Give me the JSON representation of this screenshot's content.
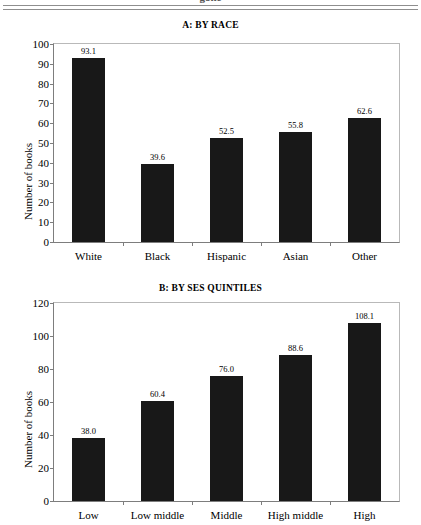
{
  "header": {
    "clipped_running_head": "gone"
  },
  "charts": [
    {
      "id": "a",
      "title": "A: BY RACE",
      "ylabel": "Number of books",
      "yticks": [
        "0",
        "10",
        "20",
        "30",
        "40",
        "50",
        "60",
        "70",
        "80",
        "90",
        "100"
      ],
      "categories": [
        "White",
        "Black",
        "Hispanic",
        "Asian",
        "Other"
      ],
      "values": [
        93.1,
        39.6,
        52.5,
        55.8,
        62.6
      ],
      "value_labels": [
        "93.1",
        "39.6",
        "52.5",
        "55.8",
        "62.6"
      ],
      "ymin": 0,
      "ymax": 100
    },
    {
      "id": "b",
      "title": "B: BY SES QUINTILES",
      "ylabel": "Number of books",
      "yticks": [
        "0",
        "20",
        "40",
        "60",
        "80",
        "100",
        "120"
      ],
      "categories": [
        "Low",
        "Low middle",
        "Middle",
        "High middle",
        "High"
      ],
      "values": [
        38.0,
        60.4,
        76.0,
        88.6,
        108.1
      ],
      "value_labels": [
        "38.0",
        "60.4",
        "76.0",
        "88.6",
        "108.1"
      ],
      "ymin": 0,
      "ymax": 120
    }
  ],
  "chart_data": [
    {
      "type": "bar",
      "title": "A: BY RACE",
      "xlabel": "",
      "ylabel": "Number of books",
      "categories": [
        "White",
        "Black",
        "Hispanic",
        "Asian",
        "Other"
      ],
      "values": [
        93.1,
        39.6,
        52.5,
        55.8,
        62.6
      ],
      "ylim": [
        0,
        100
      ],
      "ytick_step": 10,
      "grid": false,
      "legend": "none",
      "bar_color": "#181818",
      "data_labels": true
    },
    {
      "type": "bar",
      "title": "B: BY SES QUINTILES",
      "xlabel": "",
      "ylabel": "Number of books",
      "categories": [
        "Low",
        "Low middle",
        "Middle",
        "High middle",
        "High"
      ],
      "values": [
        38.0,
        60.4,
        76.0,
        88.6,
        108.1
      ],
      "ylim": [
        0,
        120
      ],
      "ytick_step": 20,
      "grid": false,
      "legend": "none",
      "bar_color": "#181818",
      "data_labels": true
    }
  ]
}
